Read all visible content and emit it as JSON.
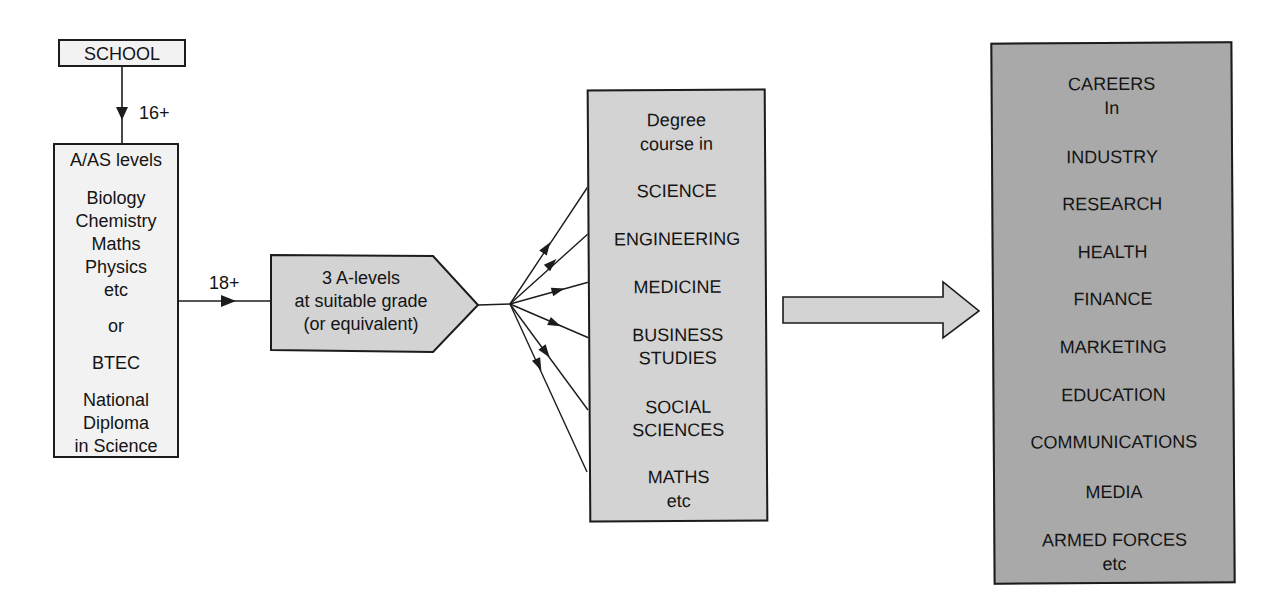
{
  "diagram": {
    "school": {
      "label": "SCHOOL"
    },
    "arrow_school_to_alevels": {
      "label": "16+"
    },
    "alevels": {
      "lines": [
        "A/AS levels",
        "Biology",
        "Chemistry",
        "Maths",
        "Physics",
        "etc",
        "or",
        "BTEC",
        "National",
        "Diploma",
        "in Science"
      ]
    },
    "arrow_alevels_to_requirement": {
      "label": "18+"
    },
    "requirement": {
      "lines": [
        "3 A-levels",
        "at suitable grade",
        "(or equivalent)"
      ]
    },
    "degree": {
      "heading": [
        "Degree",
        "course in"
      ],
      "subjects": [
        [
          "SCIENCE"
        ],
        [
          "ENGINEERING"
        ],
        [
          "MEDICINE"
        ],
        [
          "BUSINESS",
          "STUDIES"
        ],
        [
          "SOCIAL",
          "SCIENCES"
        ],
        [
          "MATHS",
          "etc"
        ]
      ]
    },
    "careers": {
      "heading": [
        "CAREERS",
        "In"
      ],
      "fields": [
        "INDUSTRY",
        "RESEARCH",
        "HEALTH",
        "FINANCE",
        "MARKETING",
        "EDUCATION",
        "COMMUNICATIONS",
        "MEDIA",
        "ARMED FORCES",
        "etc"
      ]
    },
    "colors": {
      "stroke": "#1c1c1c",
      "school_fill": "#f2f2f2",
      "alevels_fill": "#f2f2f2",
      "requirement_fill": "#d3d3d3",
      "degree_fill": "#d3d3d3",
      "big_arrow_fill": "#d3d3d3",
      "careers_fill": "#a9a9a9"
    }
  }
}
